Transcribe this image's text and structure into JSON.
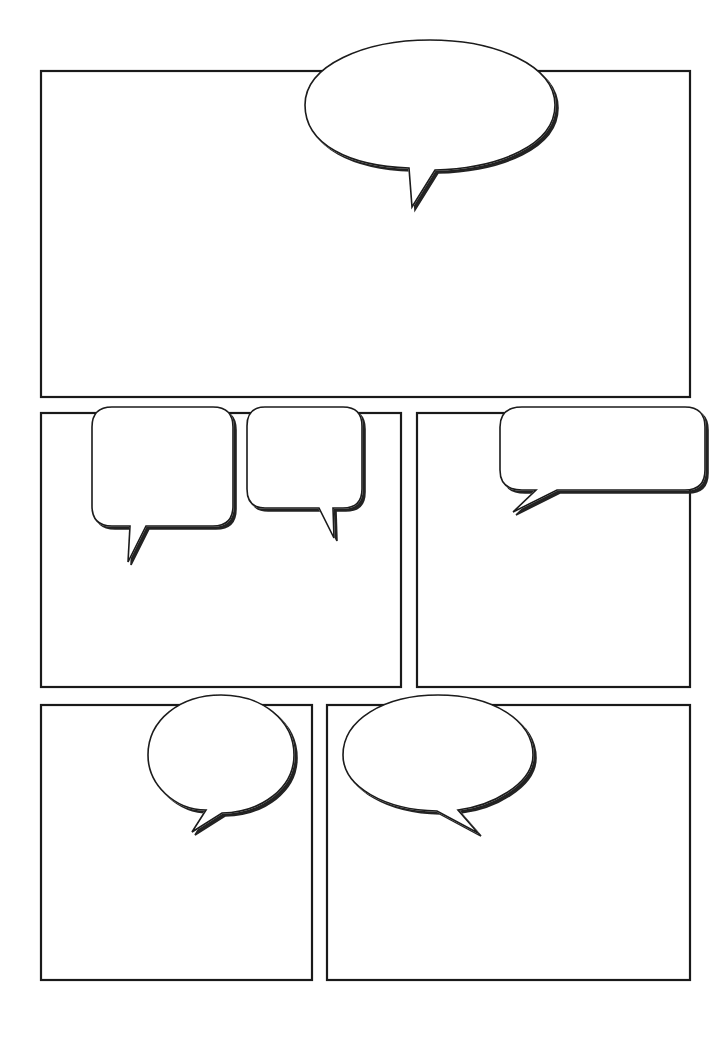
{
  "page": {
    "title": "",
    "background": "#ffffff",
    "ink_color": "#1a1a1a",
    "shadow_color": "#222222"
  },
  "panels": [
    {
      "id": "panel-1",
      "x": 41,
      "y": 71,
      "w": 649,
      "h": 326
    },
    {
      "id": "panel-2",
      "x": 41,
      "y": 413,
      "w": 360,
      "h": 274
    },
    {
      "id": "panel-3",
      "x": 417,
      "y": 413,
      "w": 273,
      "h": 274
    },
    {
      "id": "panel-4",
      "x": 41,
      "y": 705,
      "w": 271,
      "h": 275
    },
    {
      "id": "panel-5",
      "x": 327,
      "y": 705,
      "w": 363,
      "h": 275
    }
  ],
  "bubbles": [
    {
      "id": "bubble-1",
      "shape": "oval",
      "text": ""
    },
    {
      "id": "bubble-2",
      "shape": "rounded-rect",
      "text": ""
    },
    {
      "id": "bubble-3",
      "shape": "rounded-rect",
      "text": ""
    },
    {
      "id": "bubble-4",
      "shape": "rounded-rect",
      "text": ""
    },
    {
      "id": "bubble-5",
      "shape": "oval",
      "text": ""
    },
    {
      "id": "bubble-6",
      "shape": "oval",
      "text": ""
    }
  ]
}
